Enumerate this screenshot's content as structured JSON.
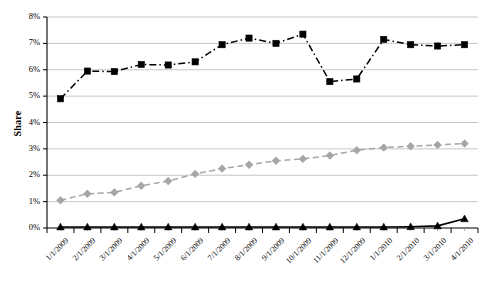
{
  "chart_data": {
    "type": "line",
    "title": "",
    "subtitle": "",
    "xlabel": "",
    "ylabel": "Share",
    "ylim": [
      0,
      8
    ],
    "ytick_labels": [
      "0%",
      "1%",
      "2%",
      "3%",
      "4%",
      "5%",
      "6%",
      "7%",
      "8%"
    ],
    "ytick_values": [
      0,
      1,
      2,
      3,
      4,
      5,
      6,
      7,
      8
    ],
    "yunit": "%",
    "grid": "horizontal",
    "legend": "none",
    "categories": [
      "1/1/2009",
      "2/1/2009",
      "3/1/2009",
      "4/1/2009",
      "5/1/2009",
      "6/1/2009",
      "7/1/2009",
      "8/1/2009",
      "9/1/2009",
      "10/1/2009",
      "11/1/2009",
      "12/1/2009",
      "1/1/2010",
      "2/1/2010",
      "3/1/2010",
      "4/1/2010"
    ],
    "series": [
      {
        "name": "series-squares",
        "marker": "square",
        "color": "#000000",
        "linestyle": "dash-dot",
        "values": [
          4.9,
          5.95,
          5.93,
          6.2,
          6.18,
          6.3,
          6.95,
          7.2,
          7.0,
          7.35,
          5.55,
          5.65,
          7.15,
          6.95,
          6.9,
          6.95
        ]
      },
      {
        "name": "series-diamonds",
        "marker": "diamond",
        "color": "#a6a6a6",
        "linestyle": "dashed",
        "values": [
          1.05,
          1.3,
          1.35,
          1.6,
          1.78,
          2.05,
          2.25,
          2.4,
          2.55,
          2.62,
          2.75,
          2.95,
          3.05,
          3.1,
          3.15,
          3.2
        ]
      },
      {
        "name": "series-triangles",
        "marker": "triangle",
        "color": "#000000",
        "linestyle": "solid",
        "values": [
          0.04,
          0.04,
          0.04,
          0.04,
          0.04,
          0.04,
          0.04,
          0.04,
          0.04,
          0.04,
          0.04,
          0.04,
          0.04,
          0.05,
          0.08,
          0.35
        ]
      }
    ],
    "plot_area": {
      "left": 47,
      "right": 478,
      "top": 17,
      "bottom": 228
    },
    "colors": {
      "axis": "#000000",
      "gridline": "#bfbfbf",
      "background": "#ffffff",
      "series_dark": "#000000",
      "series_gray": "#a6a6a6"
    }
  }
}
